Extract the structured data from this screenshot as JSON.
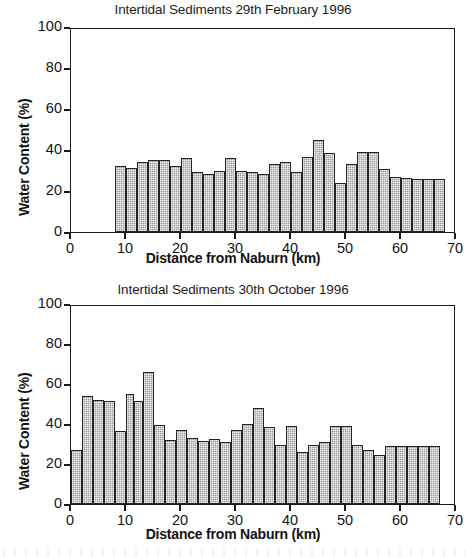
{
  "figure": {
    "xlabel": "Distance from Naburn (km)",
    "ylabel": "Water Content (%)",
    "y_ticks": [
      "0",
      "20",
      "40",
      "60",
      "80",
      "100"
    ],
    "x_ticks": [
      "0",
      "10",
      "20",
      "30",
      "40",
      "50",
      "60",
      "70"
    ]
  },
  "chart_data": [
    {
      "type": "bar",
      "title": "Intertidal Sediments 29th February 1996",
      "xlabel": "Distance from Naburn (km)",
      "ylabel": "Water Content (%)",
      "xlim": [
        0,
        70
      ],
      "ylim": [
        0,
        100
      ],
      "xtick_values": [
        0,
        10,
        20,
        30,
        40,
        50,
        60,
        70
      ],
      "ytick_values": [
        0,
        20,
        40,
        60,
        80,
        100
      ],
      "grid": false,
      "legend": "none",
      "bar_edges_km": [
        8,
        10,
        12,
        14,
        16,
        18,
        20,
        22,
        24,
        26,
        28,
        30,
        32,
        34,
        36,
        38,
        40,
        42,
        44,
        46,
        48,
        50,
        52,
        54,
        56,
        58,
        60,
        62,
        64,
        66,
        68
      ],
      "categories": [
        "8-10",
        "10-12",
        "12-14",
        "14-16",
        "16-18",
        "18-20",
        "20-22",
        "22-24",
        "24-26",
        "26-28",
        "28-30",
        "30-32",
        "32-34",
        "34-36",
        "36-38",
        "38-40",
        "40-42",
        "42-44",
        "44-46",
        "46-48",
        "48-50",
        "50-52",
        "52-54",
        "54-56",
        "56-58",
        "58-60",
        "60-62",
        "62-64",
        "64-66",
        "66-68"
      ],
      "values": [
        32,
        31,
        34,
        35,
        35,
        32,
        36,
        29.5,
        28.5,
        30,
        36,
        30,
        29.5,
        28.5,
        33,
        34,
        29.5,
        36.5,
        45,
        38.5,
        24,
        33,
        39,
        39,
        30.5,
        27,
        26.5,
        26,
        26,
        26
      ]
    },
    {
      "type": "bar",
      "title": "Intertidal Sediments 30th October 1996",
      "xlabel": "Distance from Naburn (km)",
      "ylabel": "Water Content (%)",
      "xlim": [
        0,
        70
      ],
      "ylim": [
        0,
        100
      ],
      "xtick_values": [
        0,
        10,
        20,
        30,
        40,
        50,
        60,
        70
      ],
      "ytick_values": [
        0,
        20,
        40,
        60,
        80,
        100
      ],
      "grid": false,
      "legend": "none",
      "bar_edges_km": [
        0,
        2,
        4,
        6,
        8,
        10,
        11.5,
        13,
        15,
        17,
        19,
        21,
        23,
        25,
        27,
        29,
        31,
        33,
        35,
        37,
        39,
        41,
        43,
        45,
        47,
        49,
        51,
        53,
        55,
        57,
        59,
        61,
        63,
        65,
        67
      ],
      "categories": [
        "0-2",
        "2-4",
        "4-6",
        "6-8",
        "8-10",
        "10-11.5",
        "11.5-13",
        "13-15",
        "15-17",
        "17-19",
        "19-21",
        "21-23",
        "23-25",
        "25-27",
        "27-29",
        "29-31",
        "31-33",
        "33-35",
        "35-37",
        "37-39",
        "39-41",
        "41-43",
        "43-45",
        "45-47",
        "47-49",
        "49-51",
        "51-53",
        "53-55",
        "55-57",
        "57-59",
        "59-61",
        "61-63",
        "63-65",
        "65-67"
      ],
      "values": [
        27,
        54,
        52,
        51.5,
        36.5,
        55,
        51.5,
        66,
        39.5,
        32,
        37,
        33,
        31.5,
        32.5,
        31,
        37,
        40,
        48,
        38.5,
        29.5,
        39,
        26,
        29.5,
        31,
        39,
        39,
        29.5,
        27,
        24.5,
        29,
        29,
        29,
        29,
        29
      ]
    }
  ]
}
